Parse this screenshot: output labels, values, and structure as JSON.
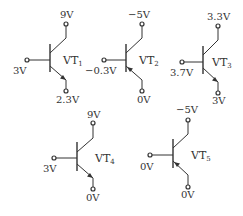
{
  "diagram": {
    "type": "transistor-terminal-voltages",
    "transistors": [
      {
        "id": "VT1",
        "name": "VT",
        "subscript": "1",
        "polarity": "NPN",
        "collector_voltage": "9V",
        "base_voltage": "3V",
        "emitter_voltage": "2.3V"
      },
      {
        "id": "VT2",
        "name": "VT",
        "subscript": "2",
        "polarity": "PNP",
        "collector_voltage": "−5V",
        "base_voltage": "−0.3V",
        "emitter_voltage": "0V"
      },
      {
        "id": "VT3",
        "name": "VT",
        "subscript": "3",
        "polarity": "NPN",
        "collector_voltage": "3.3V",
        "base_voltage": "3.7V",
        "emitter_voltage": "3V"
      },
      {
        "id": "VT4",
        "name": "VT",
        "subscript": "4",
        "polarity": "NPN",
        "collector_voltage": "9V",
        "base_voltage": "3V",
        "emitter_voltage": "0V"
      },
      {
        "id": "VT5",
        "name": "VT",
        "subscript": "5",
        "polarity": "PNP",
        "collector_voltage": "−5V",
        "base_voltage": "0V",
        "emitter_voltage": "0V"
      }
    ],
    "colors": {
      "line": "#333333",
      "background": "#ffffff"
    }
  }
}
